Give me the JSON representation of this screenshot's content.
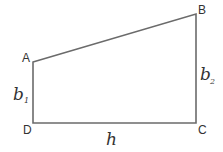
{
  "diagram": {
    "type": "trapezoid",
    "colors": {
      "stroke": "#6b6b6b",
      "text": "#333333",
      "background": "#ffffff"
    },
    "vertices": [
      {
        "id": "A",
        "label": "A",
        "x": 33,
        "y": 62
      },
      {
        "id": "B",
        "label": "B",
        "x": 196,
        "y": 14
      },
      {
        "id": "C",
        "label": "C",
        "x": 196,
        "y": 123
      },
      {
        "id": "D",
        "label": "D",
        "x": 33,
        "y": 123
      }
    ],
    "edges": [
      {
        "from": "A",
        "to": "B"
      },
      {
        "from": "B",
        "to": "C",
        "label": "b",
        "subscript": "2"
      },
      {
        "from": "C",
        "to": "D",
        "label": "h"
      },
      {
        "from": "D",
        "to": "A",
        "label": "b",
        "subscript": "1"
      }
    ],
    "labels": {
      "A": "A",
      "B": "B",
      "C": "C",
      "D": "D",
      "b1_main": "b",
      "b1_sub": "1",
      "b2_main": "b",
      "b2_sub": "2",
      "h": "h"
    }
  }
}
